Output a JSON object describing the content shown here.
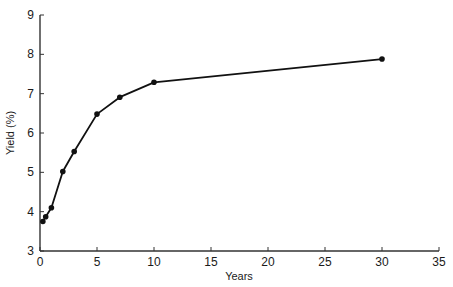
{
  "chart_data": {
    "type": "line",
    "title": "",
    "xlabel": "Years",
    "ylabel": "Yield (%)",
    "xlim": [
      0,
      35
    ],
    "ylim": [
      3,
      9
    ],
    "xticks": [
      0,
      5,
      10,
      15,
      20,
      25,
      30,
      35
    ],
    "yticks": [
      3,
      4,
      5,
      6,
      7,
      8,
      9
    ],
    "grid": false,
    "legend": null,
    "series": [
      {
        "name": "Yield curve",
        "marker": "circle",
        "color": "#111111",
        "x": [
          0.25,
          0.5,
          1,
          2,
          3,
          5,
          7,
          10,
          30
        ],
        "y": [
          3.75,
          3.87,
          4.1,
          5.02,
          5.53,
          6.48,
          6.91,
          7.29,
          7.88
        ]
      }
    ]
  },
  "layout": {
    "plot_left": 40,
    "plot_right": 439,
    "plot_top": 15,
    "plot_bottom": 251,
    "axis_color": "#333333",
    "line_color": "#111111"
  }
}
